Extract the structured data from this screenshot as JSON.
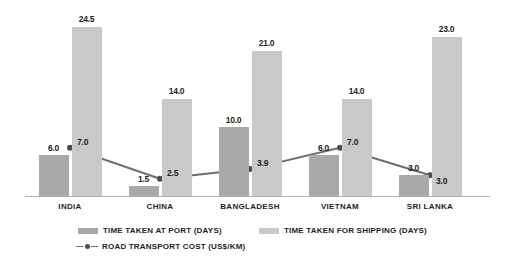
{
  "chart_data": {
    "type": "bar",
    "title": "",
    "subtitle": "",
    "xlabel": "",
    "ylabel": "",
    "ylim": [
      0,
      24.5
    ],
    "grid": false,
    "legend_position": "bottom-left",
    "categories": [
      "INDIA",
      "CHINA",
      "BANGLADESH",
      "VIETNAM",
      "SRI LANKA"
    ],
    "series": [
      {
        "name": "TIME TAKEN AT PORT (DAYS)",
        "type": "bar",
        "color": "#a9a9a9",
        "values": [
          6.0,
          1.5,
          10.0,
          6.0,
          3.0
        ],
        "labels": [
          "6.0",
          "1.5",
          "10.0",
          "6.0",
          "3.0"
        ]
      },
      {
        "name": "TIME TAKEN FOR SHIPPING (DAYS)",
        "type": "bar",
        "color": "#c9c9c9",
        "values": [
          24.5,
          14.0,
          21.0,
          14.0,
          23.0
        ],
        "labels": [
          "24.5",
          "14.0",
          "21.0",
          "14.0",
          "23.0"
        ]
      },
      {
        "name": "ROAD TRANSPORT COST (US$/KM)",
        "type": "line",
        "color": "#6e6e6e",
        "values": [
          7.0,
          2.5,
          3.9,
          7.0,
          3.0
        ],
        "labels": [
          "7.0",
          "2.5",
          "3.9",
          "7.0",
          "3.0"
        ]
      }
    ]
  },
  "legend": {
    "items": [
      {
        "label": "TIME TAKEN AT PORT (DAYS)",
        "color": "#a9a9a9",
        "marker": "square-swatch"
      },
      {
        "label": "TIME TAKEN FOR SHIPPING (DAYS)",
        "color": "#c9c9c9",
        "marker": "square-swatch"
      },
      {
        "label": "ROAD TRANSPORT COST (US$/KM)",
        "color": "#6e6e6e",
        "marker": "line-dot"
      }
    ]
  },
  "colors": {
    "port_bar": "#a9a9a9",
    "shipping_bar": "#c9c9c9",
    "line": "#6e6e6e",
    "line_marker": "#4d4d4d",
    "axis": "#b0b0b0",
    "text": "#231f20",
    "background": "#ffffff"
  }
}
